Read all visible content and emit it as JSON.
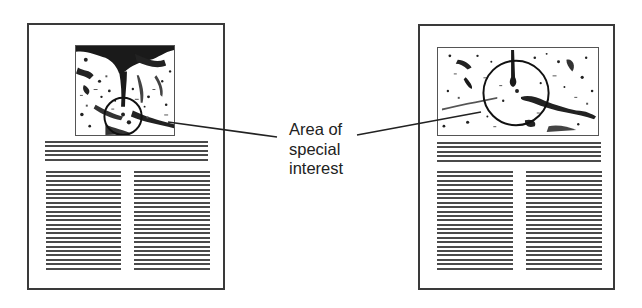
{
  "figure": {
    "callout_label": [
      "Area of",
      "special",
      "interest"
    ],
    "pages": [
      {
        "name": "left-page",
        "image_orientation": "square",
        "headline_lines": 5,
        "column_lines": 23,
        "highlight": "circle on lower-center of image"
      },
      {
        "name": "right-page",
        "image_orientation": "wide",
        "headline_lines": 5,
        "column_lines": 23,
        "highlight": "circle on center of image"
      }
    ],
    "colors": {
      "ink": "#222222",
      "border": "#3a3a3a",
      "rules": "#4a4a4a",
      "background": "#ffffff"
    }
  }
}
